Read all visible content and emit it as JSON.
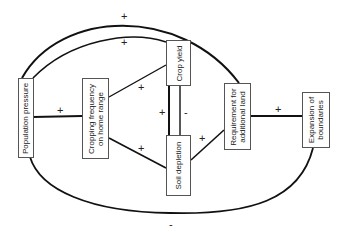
{
  "diagram": {
    "type": "causal-loop",
    "nodes": [
      {
        "id": "population",
        "label_line1": "Population pressure",
        "label_line2": ""
      },
      {
        "id": "cropping",
        "label_line1": "Cropping frequency",
        "label_line2": "on home range"
      },
      {
        "id": "crop_yield",
        "label_line1": "Crop yield",
        "label_line2": ""
      },
      {
        "id": "soil",
        "label_line1": "Soil depletion",
        "label_line2": ""
      },
      {
        "id": "requirement",
        "label_line1": "Requirement for",
        "label_line2": "additional land"
      },
      {
        "id": "expansion",
        "label_line1": "Expansion of",
        "label_line2": "boundaries"
      }
    ],
    "edges": [
      {
        "from": "population",
        "to": "requirement",
        "sign": "+"
      },
      {
        "from": "population",
        "to": "crop_yield",
        "sign": "+"
      },
      {
        "from": "population",
        "to": "cropping",
        "sign": "+"
      },
      {
        "from": "cropping",
        "to": "crop_yield",
        "sign": "+"
      },
      {
        "from": "cropping",
        "to": "soil",
        "sign": "+"
      },
      {
        "from": "crop_yield",
        "to": "soil",
        "sign": "+"
      },
      {
        "from": "soil",
        "to": "crop_yield",
        "sign": "-"
      },
      {
        "from": "soil",
        "to": "requirement",
        "sign": "+"
      },
      {
        "from": "requirement",
        "to": "expansion",
        "sign": "+"
      },
      {
        "from": "expansion",
        "to": "population",
        "sign": "-"
      }
    ],
    "signs": {
      "outer_top": "+",
      "inner_top": "+",
      "pop_crop": "+",
      "crop_yield": "+",
      "crop_soil": "+",
      "yield_soil": "+",
      "soil_yield": "-",
      "soil_req": "+",
      "req_exp": "+",
      "bottom": "-"
    }
  }
}
